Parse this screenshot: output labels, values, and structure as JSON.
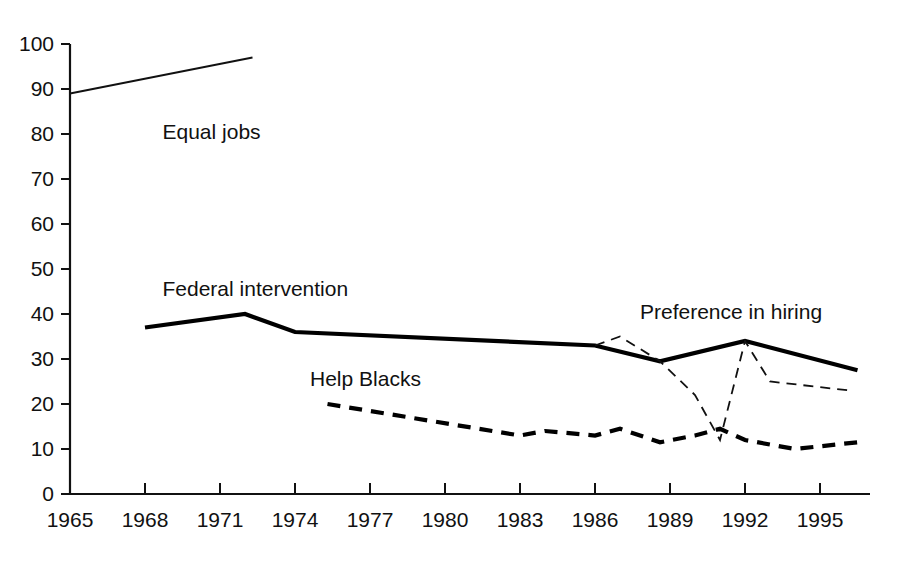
{
  "chart_data": {
    "type": "line",
    "title": "",
    "xlabel": "",
    "ylabel": "",
    "xlim": [
      1965,
      1997
    ],
    "ylim": [
      0,
      100
    ],
    "grid": false,
    "legend_position": "inline-annotations",
    "xticks": [
      "1965",
      "1968",
      "1971",
      "1974",
      "1977",
      "1980",
      "1983",
      "1986",
      "1989",
      "1992",
      "1995"
    ],
    "xtick_values": [
      1965,
      1968,
      1971,
      1974,
      1977,
      1980,
      1983,
      1986,
      1989,
      1992,
      1995
    ],
    "yticks": [
      "0",
      "10",
      "20",
      "30",
      "40",
      "50",
      "60",
      "70",
      "80",
      "90",
      "100"
    ],
    "ytick_values": [
      0,
      10,
      20,
      30,
      40,
      50,
      60,
      70,
      80,
      90,
      100
    ],
    "series": [
      {
        "name": "Equal jobs",
        "style": "thin-solid",
        "color": "#111111",
        "label_x": 1968.7,
        "label_y": 79,
        "x": [
          1965,
          1972.3
        ],
        "y": [
          89,
          97
        ]
      },
      {
        "name": "Federal intervention",
        "style": "thick-solid",
        "color": "#000000",
        "label_x": 1968.7,
        "label_y": 44,
        "x": [
          1968,
          1972,
          1974,
          1986,
          1988.6,
          1992,
          1996.5
        ],
        "y": [
          37,
          40,
          36,
          33,
          29.5,
          34,
          27.5
        ]
      },
      {
        "name": "Help Blacks",
        "style": "thick-dashed",
        "color": "#000000",
        "label_x": 1974.6,
        "label_y": 24,
        "x": [
          1975.3,
          1983,
          1984,
          1986,
          1987,
          1988.6,
          1990,
          1991,
          1992,
          1994,
          1996.5
        ],
        "y": [
          20,
          13,
          14,
          13,
          14.5,
          11.5,
          13,
          14.5,
          12,
          10,
          11.5
        ]
      },
      {
        "name": "Preference in hiring",
        "style": "thin-dashed",
        "color": "#111111",
        "label_x": 1987.8,
        "label_y": 39,
        "x": [
          1986,
          1987,
          1988.6,
          1990,
          1991,
          1992,
          1993,
          1996.2
        ],
        "y": [
          33,
          35,
          29.5,
          22,
          12,
          34,
          25,
          23
        ]
      }
    ]
  }
}
